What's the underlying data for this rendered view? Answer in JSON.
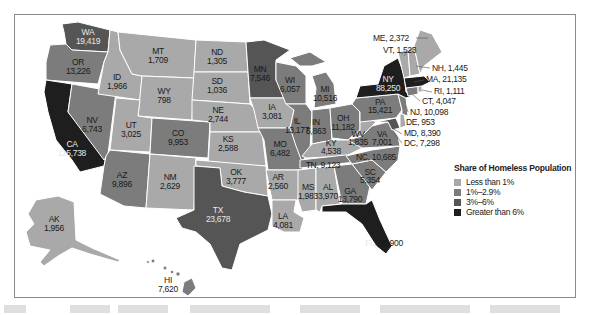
{
  "legend": {
    "title": "Share of Homeless Population",
    "items": [
      {
        "label": "Less than 1%",
        "color": "#a9a9a9"
      },
      {
        "label": "1%–2.9%",
        "color": "#7c7c7c"
      },
      {
        "label": "3%–6%",
        "color": "#555555"
      },
      {
        "label": "Greater than 6%",
        "color": "#1e1e1e"
      }
    ]
  },
  "states": {
    "WA": {
      "abbr": "WA",
      "value": "19,419",
      "category": "3%–6%"
    },
    "OR": {
      "abbr": "OR",
      "value": "13,226",
      "category": "1%–2.9%"
    },
    "CA": {
      "abbr": "CA",
      "value": "115,738",
      "category": "Greater than 6%"
    },
    "NV": {
      "abbr": "NV",
      "value": "6,743",
      "category": "1%–2.9%"
    },
    "ID": {
      "abbr": "ID",
      "value": "1,966",
      "category": "Less than 1%"
    },
    "MT": {
      "abbr": "MT",
      "value": "1,709",
      "category": "Less than 1%"
    },
    "WY": {
      "abbr": "WY",
      "value": "798",
      "category": "Less than 1%"
    },
    "UT": {
      "abbr": "UT",
      "value": "3,025",
      "category": "Less than 1%"
    },
    "CO": {
      "abbr": "CO",
      "value": "9,953",
      "category": "1%–2.9%"
    },
    "AZ": {
      "abbr": "AZ",
      "value": "9,896",
      "category": "1%–2.9%"
    },
    "NM": {
      "abbr": "NM",
      "value": "2,629",
      "category": "Less than 1%"
    },
    "ND": {
      "abbr": "ND",
      "value": "1,305",
      "category": "Less than 1%"
    },
    "SD": {
      "abbr": "SD",
      "value": "1,036",
      "category": "Less than 1%"
    },
    "NE": {
      "abbr": "NE",
      "value": "2,744",
      "category": "Less than 1%"
    },
    "KS": {
      "abbr": "KS",
      "value": "2,588",
      "category": "Less than 1%"
    },
    "OK": {
      "abbr": "OK",
      "value": "3,777",
      "category": "Less than 1%"
    },
    "TX": {
      "abbr": "TX",
      "value": "23,678",
      "category": "3%–6%"
    },
    "MN": {
      "abbr": "MN",
      "value": "7,546",
      "category": "1%–2.9%"
    },
    "IA": {
      "abbr": "IA",
      "value": "3,081",
      "category": "Less than 1%"
    },
    "MO": {
      "abbr": "MO",
      "value": "6,482",
      "category": "1%–2.9%"
    },
    "AR": {
      "abbr": "AR",
      "value": "2,560",
      "category": "Less than 1%"
    },
    "LA": {
      "abbr": "LA",
      "value": "4,081",
      "category": "Less than 1%"
    },
    "WI": {
      "abbr": "WI",
      "value": "6,057",
      "category": "1%–2.9%"
    },
    "IL": {
      "abbr": "IL",
      "value": "13,177",
      "category": "1%–2.9%"
    },
    "MI": {
      "abbr": "MI",
      "value": "10,516",
      "category": "1%–2.9%"
    },
    "IN": {
      "abbr": "IN",
      "value": "5,863",
      "category": "1%–2.9%"
    },
    "OH": {
      "abbr": "OH",
      "value": "11,182",
      "category": "1%–2.9%"
    },
    "KY": {
      "abbr": "KY",
      "value": "4,538",
      "category": "Less than 1%"
    },
    "TN": {
      "abbr": "TN",
      "value": "9,123",
      "category": "1%–2.9%"
    },
    "MS": {
      "abbr": "MS",
      "value": "1,983",
      "category": "Less than 1%"
    },
    "AL": {
      "abbr": "AL",
      "value": "3,970",
      "category": "Less than 1%"
    },
    "GA": {
      "abbr": "GA",
      "value": "13,790",
      "category": "1%–2.9%"
    },
    "FL": {
      "abbr": "FL",
      "value": "35,900",
      "category": "Greater than 6%"
    },
    "SC": {
      "abbr": "SC",
      "value": "5,354",
      "category": "1%–2.9%"
    },
    "NC": {
      "abbr": "NC",
      "value": "10,685",
      "category": "1%–2.9%"
    },
    "VA": {
      "abbr": "VA",
      "value": "7,001",
      "category": "1%–2.9%"
    },
    "WV": {
      "abbr": "WV",
      "value": "1,835",
      "category": "Less than 1%"
    },
    "PA": {
      "abbr": "PA",
      "value": "15,421",
      "category": "1%–2.9%"
    },
    "NY": {
      "abbr": "NY",
      "value": "88,250",
      "category": "Greater than 6%"
    },
    "AK": {
      "abbr": "AK",
      "value": "1,956",
      "category": "Less than 1%"
    },
    "HI": {
      "abbr": "HI",
      "value": "7,620",
      "category": "1%–2.9%"
    }
  },
  "callouts": {
    "ME": "ME, 2,372",
    "VT": "VT, 1,523",
    "NH": "NH, 1,445",
    "MA": "MA, 21,135",
    "RI": "RI, 1,111",
    "CT": "CT, 4,047",
    "NJ": "NJ, 10,098",
    "DE": "DE, 953",
    "MD": "MD, 8,390",
    "DC": "DC, 7,298"
  }
}
